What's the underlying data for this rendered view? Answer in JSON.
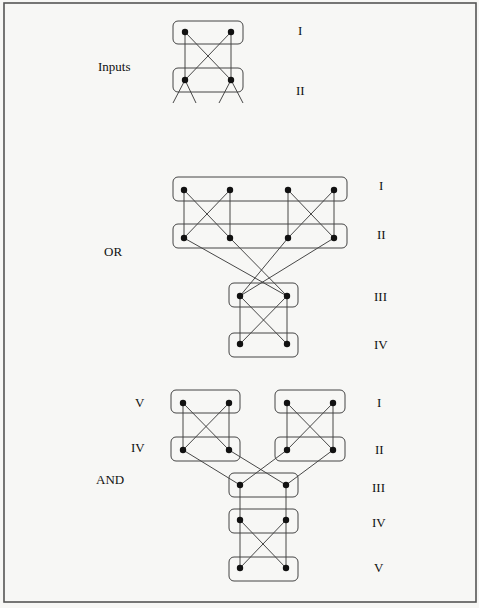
{
  "diagram": {
    "colors": {
      "background": "#f7f7f5",
      "line": "#333333",
      "node": "#111111",
      "frame": "#555555"
    },
    "frame": {
      "x": 4,
      "y": 3,
      "w": 472,
      "h": 599
    },
    "sections": [
      {
        "id": "inputs",
        "label": "Inputs",
        "label_pos": [
          98,
          71
        ],
        "level_labels": [
          {
            "text": "I",
            "x": 298,
            "y": 35
          },
          {
            "text": "II",
            "x": 296,
            "y": 95
          }
        ]
      },
      {
        "id": "or",
        "label": "OR",
        "label_pos": [
          104,
          256
        ],
        "level_labels": [
          {
            "text": "I",
            "x": 379,
            "y": 190
          },
          {
            "text": "II",
            "x": 377,
            "y": 239
          },
          {
            "text": "III",
            "x": 374,
            "y": 301
          },
          {
            "text": "IV",
            "x": 374,
            "y": 349
          }
        ]
      },
      {
        "id": "and",
        "label": "AND",
        "label_pos": [
          96,
          484
        ],
        "side_labels": [
          {
            "text": "V",
            "x": 135,
            "y": 407
          },
          {
            "text": "IV",
            "x": 131,
            "y": 452
          }
        ],
        "level_labels": [
          {
            "text": "I",
            "x": 377,
            "y": 407
          },
          {
            "text": "II",
            "x": 375,
            "y": 454
          },
          {
            "text": "III",
            "x": 372,
            "y": 492
          },
          {
            "text": "IV",
            "x": 372,
            "y": 527
          },
          {
            "text": "V",
            "x": 374,
            "y": 572
          }
        ]
      }
    ],
    "boxes": [
      {
        "section": "inputs",
        "level": "I",
        "x": 173,
        "y": 21,
        "w": 70,
        "h": 23
      },
      {
        "section": "inputs",
        "level": "II",
        "x": 173,
        "y": 68,
        "w": 70,
        "h": 24
      },
      {
        "section": "or",
        "level": "I",
        "x": 173,
        "y": 177,
        "w": 174,
        "h": 24
      },
      {
        "section": "or",
        "level": "II",
        "x": 173,
        "y": 224,
        "w": 174,
        "h": 24
      },
      {
        "section": "or",
        "level": "III",
        "x": 229,
        "y": 283,
        "w": 69,
        "h": 24
      },
      {
        "section": "or",
        "level": "IV",
        "x": 229,
        "y": 333,
        "w": 69,
        "h": 24
      },
      {
        "section": "and",
        "level": "V-left",
        "x": 171,
        "y": 390,
        "w": 69,
        "h": 23
      },
      {
        "section": "and",
        "level": "IV-left",
        "x": 171,
        "y": 437,
        "w": 69,
        "h": 24
      },
      {
        "section": "and",
        "level": "I-right",
        "x": 275,
        "y": 390,
        "w": 70,
        "h": 23
      },
      {
        "section": "and",
        "level": "II-right",
        "x": 275,
        "y": 437,
        "w": 70,
        "h": 24
      },
      {
        "section": "and",
        "level": "III",
        "x": 229,
        "y": 473,
        "w": 69,
        "h": 24
      },
      {
        "section": "and",
        "level": "IV",
        "x": 229,
        "y": 509,
        "w": 69,
        "h": 24
      },
      {
        "section": "and",
        "level": "V",
        "x": 229,
        "y": 557,
        "w": 69,
        "h": 24
      }
    ],
    "nodes": [
      [
        185,
        32
      ],
      [
        231,
        32
      ],
      [
        185,
        80
      ],
      [
        231,
        80
      ],
      [
        184,
        190
      ],
      [
        230,
        190
      ],
      [
        288,
        190
      ],
      [
        334,
        190
      ],
      [
        184,
        238
      ],
      [
        230,
        238
      ],
      [
        288,
        238
      ],
      [
        334,
        238
      ],
      [
        240,
        296
      ],
      [
        287,
        296
      ],
      [
        240,
        344
      ],
      [
        287,
        344
      ],
      [
        183,
        403
      ],
      [
        229,
        403
      ],
      [
        287,
        403
      ],
      [
        333,
        403
      ],
      [
        183,
        450
      ],
      [
        229,
        450
      ],
      [
        287,
        450
      ],
      [
        333,
        450
      ],
      [
        240,
        485
      ],
      [
        286,
        485
      ],
      [
        240,
        520
      ],
      [
        286,
        520
      ],
      [
        240,
        568
      ],
      [
        286,
        568
      ]
    ],
    "edges": [
      [
        185,
        32,
        185,
        80
      ],
      [
        231,
        32,
        231,
        80
      ],
      [
        185,
        32,
        231,
        80
      ],
      [
        231,
        32,
        185,
        80
      ],
      [
        185,
        80,
        173,
        103
      ],
      [
        185,
        80,
        196,
        103
      ],
      [
        231,
        80,
        219,
        103
      ],
      [
        231,
        80,
        243,
        103
      ],
      [
        184,
        190,
        184,
        238
      ],
      [
        230,
        190,
        230,
        238
      ],
      [
        184,
        190,
        230,
        238
      ],
      [
        230,
        190,
        184,
        238
      ],
      [
        288,
        190,
        288,
        238
      ],
      [
        334,
        190,
        334,
        238
      ],
      [
        288,
        190,
        334,
        238
      ],
      [
        334,
        190,
        288,
        238
      ],
      [
        184,
        238,
        287,
        296
      ],
      [
        230,
        238,
        287,
        296
      ],
      [
        288,
        238,
        240,
        296
      ],
      [
        334,
        238,
        240,
        296
      ],
      [
        240,
        296,
        240,
        344
      ],
      [
        287,
        296,
        287,
        344
      ],
      [
        240,
        296,
        287,
        344
      ],
      [
        287,
        296,
        240,
        344
      ],
      [
        183,
        403,
        183,
        450
      ],
      [
        229,
        403,
        229,
        450
      ],
      [
        183,
        403,
        229,
        450
      ],
      [
        229,
        403,
        183,
        450
      ],
      [
        287,
        403,
        287,
        450
      ],
      [
        333,
        403,
        333,
        450
      ],
      [
        287,
        403,
        333,
        450
      ],
      [
        333,
        403,
        287,
        450
      ],
      [
        183,
        450,
        240,
        485
      ],
      [
        229,
        450,
        286,
        485
      ],
      [
        287,
        450,
        240,
        485
      ],
      [
        333,
        450,
        286,
        485
      ],
      [
        240,
        485,
        240,
        520
      ],
      [
        286,
        485,
        286,
        520
      ],
      [
        240,
        520,
        240,
        568
      ],
      [
        286,
        520,
        286,
        568
      ],
      [
        240,
        520,
        286,
        568
      ],
      [
        286,
        520,
        240,
        568
      ]
    ]
  }
}
